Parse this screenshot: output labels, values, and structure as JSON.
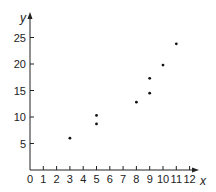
{
  "chart_data": {
    "type": "scatter",
    "title": "",
    "xlabel": "x",
    "ylabel": "y",
    "xlim": [
      0,
      12
    ],
    "ylim": [
      0,
      25
    ],
    "grid": false,
    "x_ticks": [
      0,
      1,
      2,
      3,
      4,
      5,
      6,
      7,
      8,
      9,
      10,
      11,
      12
    ],
    "y_ticks": [
      5,
      10,
      15,
      20,
      25
    ],
    "x_tick_labels": [
      "0",
      "1",
      "2",
      "3",
      "4",
      "5",
      "6",
      "7",
      "8",
      "9",
      "10",
      "11",
      "12"
    ],
    "y_tick_labels": [
      "5",
      "10",
      "15",
      "20",
      "25"
    ],
    "points": [
      {
        "x": 3,
        "y": 6
      },
      {
        "x": 5,
        "y": 8.7
      },
      {
        "x": 5,
        "y": 10.3
      },
      {
        "x": 8,
        "y": 12.8
      },
      {
        "x": 9,
        "y": 14.5
      },
      {
        "x": 9,
        "y": 17.3
      },
      {
        "x": 10,
        "y": 19.8
      },
      {
        "x": 11,
        "y": 23.8
      }
    ],
    "colors": {
      "axis": "#222222",
      "point": "#111111"
    }
  }
}
